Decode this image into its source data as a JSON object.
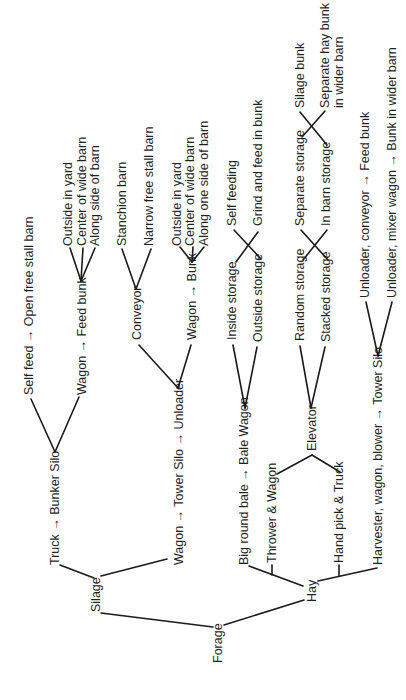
{
  "diagram": {
    "title": "",
    "orientation": "rotated-90-ccw",
    "nodes": {
      "forage": "Forage",
      "silage": "Silage",
      "hay": "Hay",
      "truck_bunker": "Truck → Bunker Silo",
      "self_feed": "Self feed → Open free stall barn",
      "wagon_feed_bunk": "Wagon → Feed bunk",
      "fb_outside_yard": "Outside in yard",
      "fb_center_wide": "Center of wide barn",
      "fb_along_side": "Along side of barn",
      "wagon_tower_unloader": "Wagon → Tower Silo → Unloader",
      "conveyor": "Conveyor",
      "stanchion_barn": "Stanchion barn",
      "narrow_free_stall": "Narrow free stall barn",
      "wagon_bunk": "Wagon → Bunk",
      "bk_outside_yard": "Outside in yard",
      "bk_center_wide": "Center of wide barn",
      "bk_along_one_side": "Along one side of barn",
      "big_round_bale": "Big round bale → Bale Wagon",
      "inside_storage": "Inside storage",
      "outside_storage": "Outside storage",
      "self_feeding": "Self feeding",
      "grind_feed": "Grind and feed in bunk",
      "thrower_wagon": "Thrower & Wagon",
      "hand_pick_truck": "Hand pick & Truck",
      "elevator": "Elevator",
      "random_storage": "Random storage",
      "stacked_storage": "Stacked storage",
      "separate_storage": "Separate storage",
      "in_barn_storage": "In barn storage",
      "silage_bunk": "Silage bunk",
      "separate_hay_bunk_1": "Separate hay bunk",
      "separate_hay_bunk_2": "in wider barn",
      "harvester_tower": "Harvester, wagon, blower → Tower Silo",
      "unloader_conveyor": "Unloader, conveyor → Feed bunk",
      "unloader_mixer": "Unloader, mixer wagon → Bunk in wider barn"
    }
  }
}
